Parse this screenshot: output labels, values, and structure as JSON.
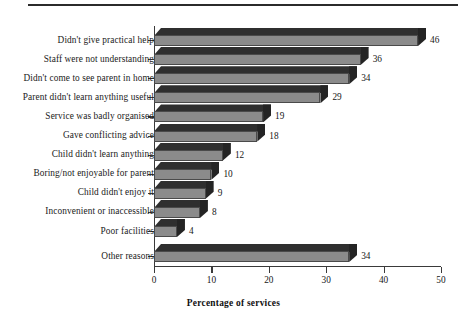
{
  "figure": {
    "top_rule": "horizontal-rule"
  },
  "chart_data": {
    "type": "bar",
    "orientation": "horizontal",
    "title": "",
    "subtitle": "",
    "xlabel": "Percentage of services",
    "ylabel": "",
    "xlim": [
      0,
      50
    ],
    "xticks": [
      0,
      10,
      20,
      30,
      40,
      50
    ],
    "xtick_labels": [
      "0",
      "10",
      "20",
      "30",
      "40",
      "50"
    ],
    "grid": false,
    "legend": null,
    "style": "3d-bar",
    "bar_face_color": "#8b8b8b",
    "bar_top_color": "#2f2f2f",
    "bar_end_color": "#242424",
    "categories": [
      "Didn't give practical help",
      "Staff were not understanding",
      "Didn't come to see parent in home",
      "Parent didn't learn anything useful",
      "Service was badly organised",
      "Gave conflicting advice",
      "Child didn't learn anything",
      "Boring/not enjoyable for parent",
      "Child didn't enjoy it",
      "Inconvenient or inaccessible",
      "Poor facilities",
      "Other reasons"
    ],
    "values": [
      46,
      36,
      34,
      29,
      19,
      18,
      12,
      10,
      9,
      8,
      4,
      34
    ],
    "data_labels": [
      "46",
      "36",
      "34",
      "29",
      "19",
      "18",
      "12",
      "10",
      "9",
      "8",
      "4",
      "34"
    ]
  }
}
